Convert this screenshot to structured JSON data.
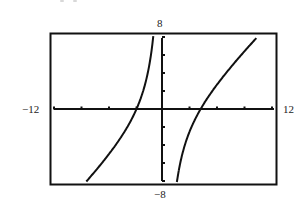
{
  "chart_data": {
    "type": "line",
    "title": "",
    "xlabel": "",
    "ylabel": "",
    "xlim": [
      -12,
      12
    ],
    "ylim": [
      -8,
      8
    ],
    "grid": false,
    "legend": null,
    "window_labels": {
      "xmin": "−12",
      "xmax": "12",
      "ymin": "−8",
      "ymax": "8"
    },
    "x_tick_step": 3,
    "y_tick_step": 2,
    "vertical_asymptote": 0,
    "x_intercepts": [
      -3,
      4
    ],
    "function_fit": "y = x - 1 - 12/x",
    "series": [
      {
        "name": "left branch",
        "x": [
          -8.4,
          -8,
          -7,
          -6,
          -5,
          -4,
          -3,
          -2,
          -1.5,
          -1.18
        ],
        "y": [
          -7.97,
          -7.5,
          -6.29,
          -5,
          -3.6,
          -2,
          0,
          3,
          5.5,
          8
        ]
      },
      {
        "name": "right branch",
        "x": [
          1.42,
          1.5,
          2,
          3,
          4,
          5,
          6,
          7,
          8,
          9,
          10
        ],
        "y": [
          -8,
          -7.5,
          -5,
          -2,
          0,
          1.6,
          3,
          4.29,
          5.5,
          6.67,
          7.8
        ]
      }
    ]
  },
  "style": {
    "line_color": "#111111",
    "frame_color": "#111111",
    "background": "#ffffff"
  }
}
